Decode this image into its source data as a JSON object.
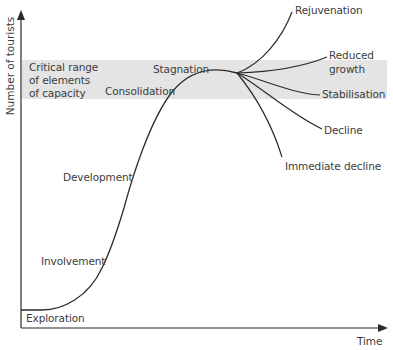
{
  "diagram": {
    "axes": {
      "y_label": "Number of tourists",
      "x_label": "Time"
    },
    "band": {
      "label_lines": [
        "Critical range",
        "of elements",
        "of capacity"
      ],
      "color": "#e4e4e4"
    },
    "stages": {
      "exploration": "Exploration",
      "involvement": "Involvement",
      "development": "Development",
      "consolidation": "Consolidation",
      "stagnation": "Stagnation"
    },
    "outcomes": {
      "rejuvenation": "Rejuvenation",
      "reduced_growth_line1": "Reduced",
      "reduced_growth_line2": "growth",
      "stabilisation": "Stabilisation",
      "decline": "Decline",
      "immediate_decline": "Immediate decline"
    },
    "colors": {
      "line": "#2a2a2a",
      "text": "#3c3c3c",
      "band": "#e4e4e4"
    }
  }
}
